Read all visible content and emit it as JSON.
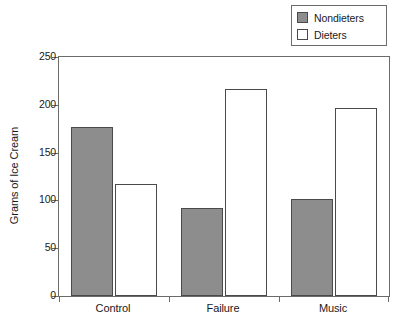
{
  "chart_data": {
    "type": "bar",
    "title": "",
    "xlabel": "",
    "ylabel": "Grams of Ice Cream",
    "categories": [
      "Control",
      "Failure",
      "Music"
    ],
    "series": [
      {
        "name": "Nondieters",
        "values": [
          177,
          92,
          102
        ],
        "color": "#8d8d8d"
      },
      {
        "name": "Dieters",
        "values": [
          117,
          217,
          197
        ],
        "color": "#ffffff"
      }
    ],
    "ylim": [
      0,
      250
    ],
    "yticks": [
      0,
      50,
      100,
      150,
      200,
      250
    ],
    "ytick_labels": [
      "0",
      "50",
      "100",
      "150",
      "200",
      "250"
    ],
    "grid": false,
    "legend_position": "top-right",
    "frame": "box"
  },
  "legend": {
    "entries": [
      {
        "label": "Nondieters",
        "swatch": "filled-square-gray"
      },
      {
        "label": "Dieters",
        "swatch": "empty-square-white"
      }
    ]
  },
  "axes": {
    "y_title": "Grams of Ice Cream",
    "y_tick_labels": [
      "250",
      "200",
      "150",
      "100",
      "50",
      "0"
    ],
    "x_tick_labels": [
      "Control",
      "Failure",
      "Music"
    ]
  }
}
